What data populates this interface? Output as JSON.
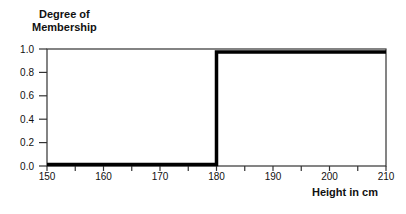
{
  "chart_data": {
    "type": "line",
    "title": "",
    "ylabel": "Degree of Membership",
    "ylabel_lines": [
      "Degree of",
      "Membership"
    ],
    "xlabel": "Height in cm",
    "xlim": [
      150,
      210
    ],
    "ylim": [
      0.0,
      1.0
    ],
    "x_ticks": [
      150,
      160,
      170,
      180,
      190,
      200,
      210
    ],
    "x_minor_ticks": [
      155,
      165,
      175,
      185,
      195,
      205
    ],
    "y_ticks": [
      "0.0",
      "0.2",
      "0.4",
      "0.6",
      "0.8",
      "1.0"
    ],
    "grid": false,
    "legend": null,
    "series": [
      {
        "name": "crisp set membership (tall)",
        "x": [
          150,
          180,
          180,
          210
        ],
        "y": [
          0.0,
          0.0,
          1.0,
          1.0
        ]
      }
    ],
    "colors": {
      "line": "#000000",
      "axis": "#333333"
    }
  }
}
